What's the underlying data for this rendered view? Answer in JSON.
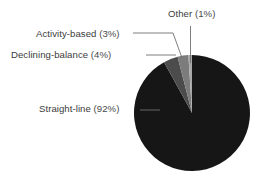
{
  "chart_data": {
    "type": "pie",
    "title": "",
    "subtitle": "",
    "xlabel": "",
    "ylabel": "",
    "legend_position": "none",
    "grid": false,
    "start_angle_deg": 0,
    "direction": "clockwise",
    "categories": [
      "Straight-line",
      "Declining-balance",
      "Activity-based",
      "Other"
    ],
    "values": [
      92,
      4,
      3,
      1
    ],
    "value_unit": "%",
    "slices": [
      {
        "name": "Straight-line",
        "label": "Straight-line",
        "value": 92,
        "value_label": "92%",
        "value_bold": true,
        "color": "#161616",
        "start_angle_deg": 0,
        "end_angle_deg": 331.2
      },
      {
        "name": "Declining-balance",
        "label": "Declining-balance",
        "value": 4,
        "value_label": "4%",
        "value_bold": true,
        "color": "#4c4c4c",
        "start_angle_deg": 331.2,
        "end_angle_deg": 345.6
      },
      {
        "name": "Activity-based",
        "label": "Activity-based",
        "value": 3,
        "value_label": "3%",
        "value_bold": false,
        "color": "#7c7c7c",
        "start_angle_deg": 345.6,
        "end_angle_deg": 356.4
      },
      {
        "name": "Other",
        "label": "Other",
        "value": 1,
        "value_label": "1%",
        "value_bold": false,
        "color": "#a8a8a8",
        "start_angle_deg": 356.4,
        "end_angle_deg": 360
      }
    ]
  },
  "labels": {
    "other": {
      "name": "Other",
      "open_paren": "(",
      "percent": "1%",
      "close_paren": ")"
    },
    "activity": {
      "name": "Activity-based",
      "open_paren": "(",
      "percent": "3%",
      "close_paren": ")"
    },
    "declining": {
      "name": "Declining-balance",
      "open_paren": "(",
      "percent": "4%",
      "close_paren": ")"
    },
    "straight": {
      "name": "Straight-line",
      "open_paren": "(",
      "percent": "92%",
      "close_paren": ")"
    }
  },
  "colors": {
    "background": "#ffffff",
    "text": "#3b3b3b",
    "leader_line": "#6f6f6f",
    "slice_straight_line": "#161616",
    "slice_declining_balance": "#4c4c4c",
    "slice_activity_based": "#7c7c7c",
    "slice_other": "#a8a8a8"
  }
}
